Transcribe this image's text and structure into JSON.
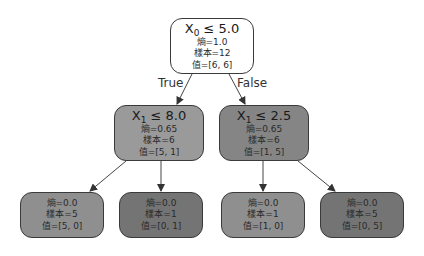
{
  "tree": {
    "root": {
      "feature": "X",
      "feature_index": "0",
      "op": " ≤ ",
      "threshold": "5.0",
      "entropy": "熵=1.0",
      "samples": "樣本=12",
      "value": "值=[6, 6]",
      "fill": "#ffffff"
    },
    "edge_labels": {
      "true_label": "True",
      "false_label": "False"
    },
    "left": {
      "feature": "X",
      "feature_index": "1",
      "op": " ≤ ",
      "threshold": "8.0",
      "entropy": "熵=0.65",
      "samples": "樣本=6",
      "value": "值=[5, 1]",
      "fill": "#9a9a9a"
    },
    "right": {
      "feature": "X",
      "feature_index": "1",
      "op": " ≤ ",
      "threshold": "2.5",
      "entropy": "熵=0.65",
      "samples": "樣本=6",
      "value": "值=[1, 5]",
      "fill": "#858585"
    },
    "leaves": [
      {
        "entropy": "熵=0.0",
        "samples": "樣本=5",
        "value": "值=[5, 0]",
        "fill": "#8f8f8f"
      },
      {
        "entropy": "熵=0.0",
        "samples": "樣本=1",
        "value": "值=[0, 1]",
        "fill": "#747474"
      },
      {
        "entropy": "熵=0.0",
        "samples": "樣本=1",
        "value": "值=[1, 0]",
        "fill": "#8f8f8f"
      },
      {
        "entropy": "熵=0.0",
        "samples": "樣本=5",
        "value": "值=[0, 5]",
        "fill": "#747474"
      }
    ]
  }
}
